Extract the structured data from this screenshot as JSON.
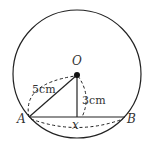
{
  "diagram": {
    "type": "geometry",
    "points": {
      "center": "O",
      "chord_start": "A",
      "chord_end": "B"
    },
    "labels": {
      "O": "O",
      "A": "A",
      "B": "B",
      "x": "x",
      "radius": "5cm",
      "distance": "3cm"
    },
    "measurements": {
      "OA": "5cm",
      "distance_O_to_AB": "3cm",
      "AB": "x"
    },
    "colors": {
      "stroke": "#222222",
      "text": "#333333",
      "background": "#ffffff"
    }
  }
}
